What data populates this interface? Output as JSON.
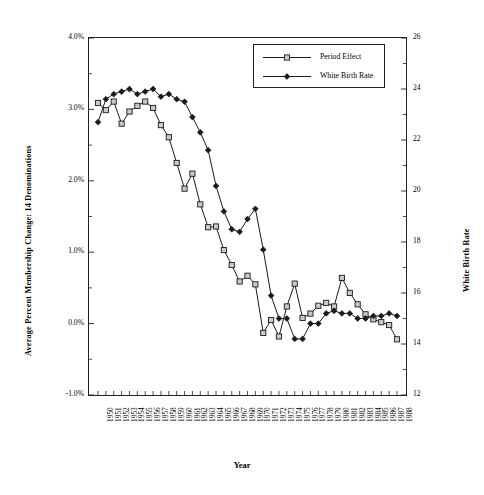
{
  "chart_data": {
    "type": "line",
    "title": "",
    "xlabel": "Year",
    "ylabel": "Average Percent Membership Change: 14 Denominations",
    "y2label": "White Birth Rate",
    "grid": false,
    "legend_position": "top-center-right",
    "x": [
      1950,
      1951,
      1952,
      1953,
      1954,
      1955,
      1956,
      1957,
      1958,
      1959,
      1960,
      1961,
      1962,
      1963,
      1964,
      1965,
      1966,
      1967,
      1968,
      1969,
      1970,
      1971,
      1972,
      1973,
      1974,
      1975,
      1976,
      1977,
      1978,
      1979,
      1980,
      1981,
      1982,
      1983,
      1984,
      1985,
      1986,
      1987,
      1988
    ],
    "xtick_labels": [
      "1950",
      "1951",
      "1952",
      "1953",
      "1954",
      "1955",
      "1956",
      "1957",
      "1958",
      "1959",
      "1960",
      "1961",
      "1962",
      "1963",
      "1964",
      "1965",
      "1966",
      "1967",
      "1968",
      "1969",
      "1970",
      "1971",
      "1972",
      "1973",
      "1974",
      "1975",
      "1976",
      "1977",
      "1978",
      "1979",
      "1980",
      "1981",
      "1982",
      "1983",
      "1984",
      "1985",
      "1986",
      "1987",
      "1988"
    ],
    "ylim": [
      -1.0,
      4.0
    ],
    "ytick_values": [
      -1.0,
      0.0,
      1.0,
      2.0,
      3.0,
      4.0
    ],
    "ytick_labels": [
      "-1.0%",
      "0.0%",
      "1.0%",
      "2.0%",
      "3.0%",
      "4.0%"
    ],
    "yminor_values": [
      -0.5,
      0.5,
      1.5,
      2.5,
      3.5
    ],
    "y2lim": [
      12,
      26
    ],
    "y2tick_values": [
      12,
      14,
      16,
      18,
      20,
      22,
      24,
      26
    ],
    "y2tick_labels": [
      "12",
      "14",
      "16",
      "18",
      "20",
      "22",
      "24",
      "26"
    ],
    "y2minor_values": [
      13,
      15,
      17,
      19,
      21,
      23,
      25
    ],
    "series": [
      {
        "name": "Period Effect",
        "axis": "left",
        "marker": "open-square",
        "values": [
          3.09,
          2.99,
          3.11,
          2.8,
          2.97,
          3.05,
          3.11,
          3.02,
          2.78,
          2.61,
          2.25,
          1.89,
          2.1,
          1.67,
          1.35,
          1.36,
          1.03,
          0.82,
          0.59,
          0.67,
          0.55,
          -0.13,
          0.05,
          -0.18,
          0.24,
          0.56,
          0.08,
          0.14,
          0.25,
          0.29,
          0.24,
          0.64,
          0.43,
          0.27,
          0.13,
          0.06,
          0.02,
          -0.02,
          -0.22
        ]
      },
      {
        "name": "White Birth Rate",
        "axis": "right",
        "marker": "filled-diamond",
        "values": [
          22.7,
          23.6,
          23.8,
          23.9,
          24.0,
          23.8,
          23.9,
          24.0,
          23.7,
          23.8,
          23.6,
          23.5,
          22.9,
          22.3,
          21.6,
          20.2,
          19.2,
          18.5,
          18.4,
          18.9,
          19.3,
          17.7,
          15.9,
          15.0,
          15.0,
          14.2,
          14.2,
          14.8,
          14.8,
          15.2,
          15.3,
          15.2,
          15.2,
          15.0,
          15.0,
          15.1,
          15.1,
          15.2,
          15.1
        ]
      }
    ]
  },
  "legend": {
    "items": [
      {
        "label": "Period Effect",
        "marker": "open-square"
      },
      {
        "label": "White Birth Rate",
        "marker": "filled-diamond"
      }
    ]
  },
  "axes": {
    "left_title": "Average Percent Membership Change: 14 Denominations",
    "right_title": "White Birth Rate",
    "bottom_title": "Year"
  },
  "colors": {
    "line": "#1a1a1a",
    "frame": "#222222",
    "marker_fill": "#c9c9c9",
    "background": "#ffffff"
  }
}
